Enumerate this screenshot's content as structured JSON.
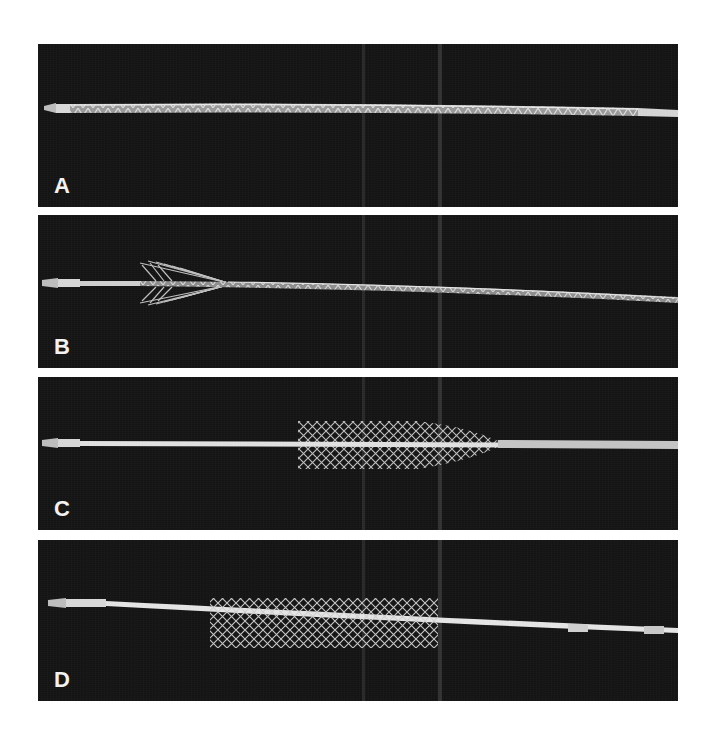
{
  "figure": {
    "background_color": "#ffffff",
    "panel_color": "#141414",
    "panels": [
      {
        "label": "A",
        "stage": "stent fully constrained within delivery sheath"
      },
      {
        "label": "B",
        "stage": "distal end of stent beginning to expand"
      },
      {
        "label": "C",
        "stage": "stent partially deployed, flared mesh"
      },
      {
        "label": "D",
        "stage": "stent fully expanded, released from catheter"
      }
    ]
  }
}
